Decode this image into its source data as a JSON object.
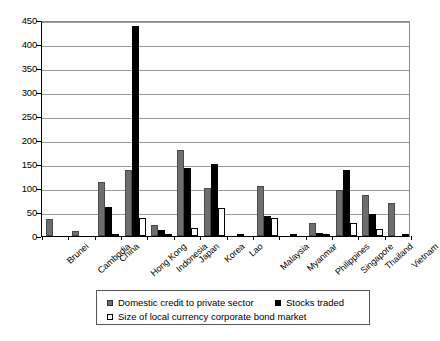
{
  "chart_data": {
    "type": "bar",
    "title": "",
    "subtitle": "",
    "xlabel": "",
    "ylabel": "",
    "ylim": [
      0,
      450
    ],
    "yticks": [
      0,
      50,
      100,
      150,
      200,
      250,
      300,
      350,
      400,
      450
    ],
    "grid": true,
    "legend_position": "bottom",
    "categories": [
      "Brunei",
      "Cambodia",
      "China",
      "Hong Kong",
      "Indonesia",
      "Japan",
      "Korea",
      "Lao",
      "Malaysia",
      "Myanmar",
      "Philippines",
      "Singapore",
      "Thailand",
      "Vietnam"
    ],
    "series": [
      {
        "name": "Domestic credit to private sector",
        "color": "#6e6e6e",
        "values": [
          35,
          11,
          112,
          138,
          23,
          180,
          100,
          0,
          105,
          0,
          28,
          96,
          85,
          68
        ]
      },
      {
        "name": "Stocks traded",
        "color": "#000000",
        "values": [
          0,
          0,
          60,
          437,
          12,
          142,
          149,
          5,
          42,
          4,
          7,
          137,
          46,
          0
        ]
      },
      {
        "name": "Size of local currency corporate bond market",
        "color": "#ffffff",
        "values": [
          0,
          0,
          3,
          38,
          2,
          16,
          59,
          0,
          37,
          0,
          2,
          27,
          14,
          1
        ]
      }
    ]
  },
  "legend": {
    "items": [
      "Domestic credit to private sector",
      "Stocks traded",
      "Size of local currency corporate bond market"
    ]
  }
}
